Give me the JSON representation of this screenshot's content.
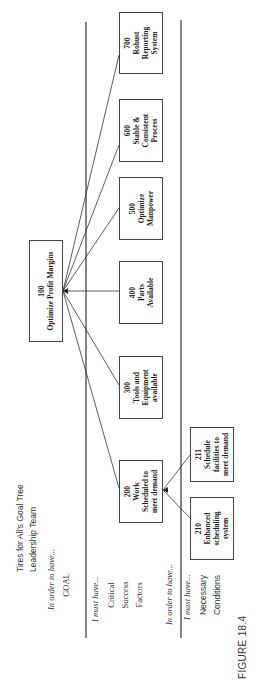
{
  "figure": {
    "title": "Tires for All's Goal Tree\nLeadership Team",
    "caption": "FIGURE 18.4"
  },
  "levels": {
    "goal": {
      "connector": "In order to have...",
      "label": "GOAL"
    },
    "csf": {
      "connector": "I must have...",
      "label": "Critical\nSuccess\nFactors"
    },
    "nc_connector_1": "In order to have...",
    "nc": {
      "connector": "I must have...",
      "label": "Necessary\nConditions"
    }
  },
  "goal_box": {
    "number": "100",
    "label": "Optimize Profit Margins"
  },
  "csf_boxes": [
    {
      "number": "200",
      "label": "Work\nScheduled to\nmeet demand"
    },
    {
      "number": "300",
      "label": "Tools and\nEquipment\navailable"
    },
    {
      "number": "400",
      "label": "Parts\nAvailable"
    },
    {
      "number": "500",
      "label": "Optimize\nManpower"
    },
    {
      "number": "600",
      "label": "Stable &\nConsistent\nProcess"
    },
    {
      "number": "700",
      "label": "Robust\nReporting\nSystem"
    }
  ],
  "nc_boxes": [
    {
      "number": "210",
      "label": "Enhanced\nscheduling\nsystem"
    },
    {
      "number": "211",
      "label": "Schedule\nfacilities to\nmeet demand"
    }
  ],
  "colors": {
    "line": "#333333",
    "box_border": "#444444",
    "background": "#ffffff"
  }
}
